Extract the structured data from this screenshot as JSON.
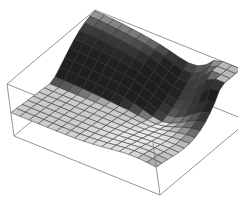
{
  "chart_data": {
    "type": "surface3d",
    "title": "",
    "xlabel": "",
    "ylabel": "",
    "zlabel": "",
    "axes_ticks": false,
    "bounding_box": true,
    "grid_mesh": true,
    "grid_resolution": [
      16,
      16
    ],
    "shading": "grayscale-lit",
    "box_corners_px": {
      "top_back_left": [
        95,
        10
      ],
      "top_back_right": [
        228,
        46
      ],
      "top_front_left": [
        7,
        84
      ],
      "bottom_front_left": [
        14,
        136
      ],
      "bottom_front_right": [
        160,
        195
      ],
      "bottom_back_right": [
        224,
        130
      ]
    },
    "colors": {
      "background": "#ffffff",
      "box_edge": "#7a7a7a",
      "mesh_line": "#2a2a2a",
      "light_face": "#e8e8e8",
      "dark_face": "#1a1a1a"
    }
  }
}
